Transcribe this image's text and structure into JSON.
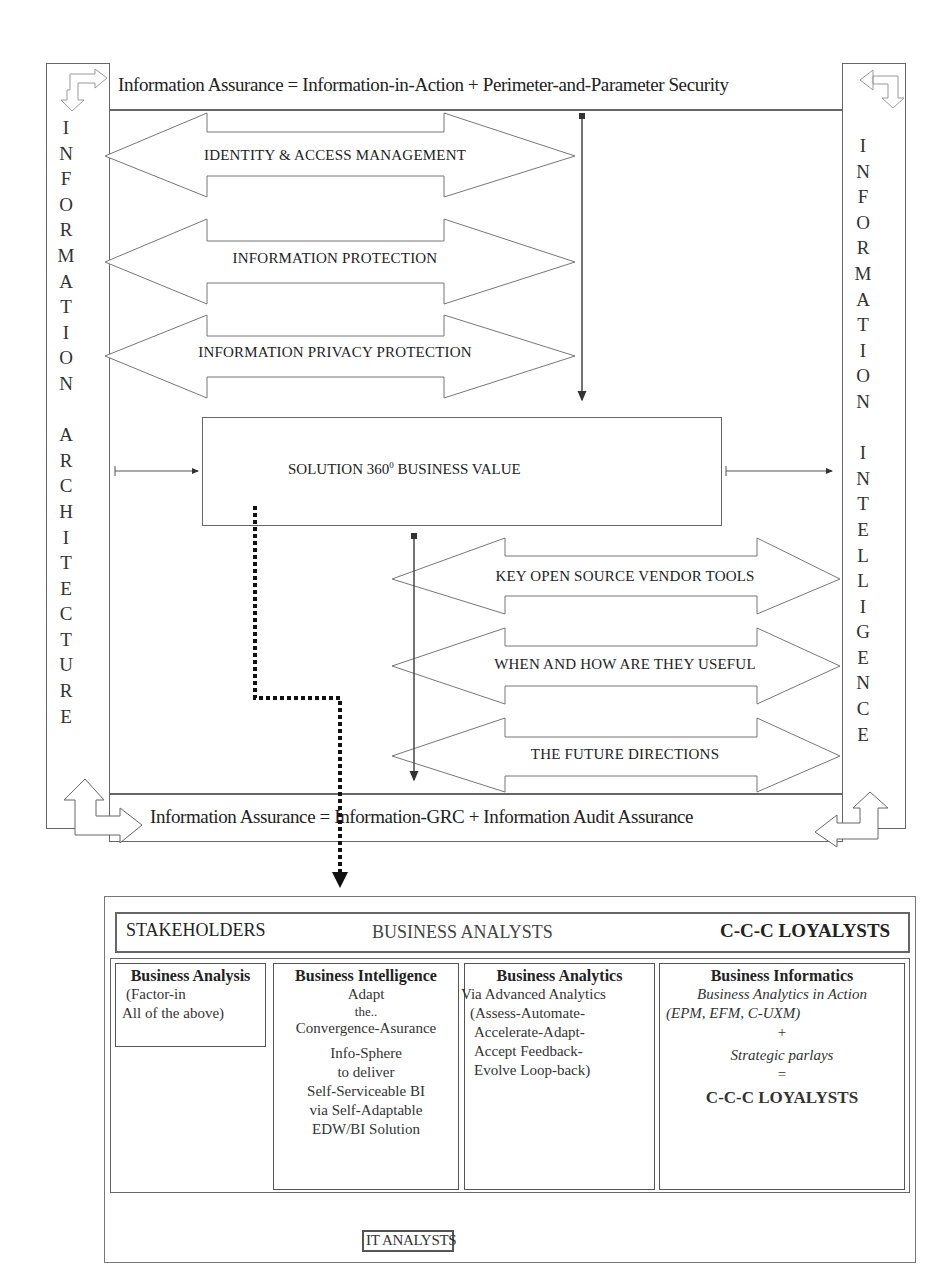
{
  "top_band": {
    "text": "Information Assurance = Information-in-Action + Perimeter-and-Parameter Security"
  },
  "bottom_band": {
    "text": "Information Assurance = Information-GRC + Information Audit Assurance"
  },
  "left_pillar": {
    "word1": [
      "I",
      "N",
      "F",
      "O",
      "R",
      "M",
      "A",
      "T",
      "I",
      "O",
      "N"
    ],
    "word2": [
      "A",
      "R",
      "C",
      "H",
      "I",
      "T",
      "E",
      "C",
      "T",
      "U",
      "R",
      "E"
    ],
    "label": "INFORMATION ARCHITECTURE"
  },
  "right_pillar": {
    "word1": [
      "I",
      "N",
      "F",
      "O",
      "R",
      "M",
      "A",
      "T",
      "I",
      "O",
      "N"
    ],
    "word2": [
      "I",
      "N",
      "T",
      "E",
      "L",
      "L",
      "I",
      "G",
      "E",
      "N",
      "C",
      "E"
    ],
    "label": "INFORMATION INTELLIGENCE"
  },
  "upper_arrows": [
    {
      "label": "IDENTITY & ACCESS MANAGEMENT"
    },
    {
      "label": "INFORMATION PROTECTION"
    },
    {
      "label": "INFORMATION PRIVACY PROTECTION"
    }
  ],
  "center_box": {
    "label_pre": "SOLUTION 360",
    "label_sup": "0",
    "label_post": " BUSINESS VALUE"
  },
  "lower_arrows": [
    {
      "label": "KEY OPEN SOURCE VENDOR TOOLS"
    },
    {
      "label": "WHEN AND HOW ARE THEY USEFUL"
    },
    {
      "label": "THE FUTURE DIRECTIONS"
    }
  ],
  "lower_panel": {
    "header": {
      "left": "STAKEHOLDERS",
      "center": "BUSINESS ANALYSTS",
      "right": "C-C-C LOYALYSTS"
    },
    "columns": [
      {
        "title": "Business Analysis",
        "lines": [
          "(Factor-in",
          "All of the above)"
        ]
      },
      {
        "title": "Business Intelligence",
        "lines": [
          "Adapt",
          "the..",
          "Convergence-Asurance",
          "Info-Sphere",
          "to deliver",
          "Self-Serviceable BI",
          "via Self-Adaptable",
          "EDW/BI Solution"
        ]
      },
      {
        "title": "Business Analytics",
        "lines": [
          "Via Advanced Analytics",
          "(Assess-Automate-",
          "Accelerate-Adapt-",
          "Accept Feedback-",
          "Evolve Loop-back)"
        ]
      },
      {
        "title": "Business Informatics",
        "lines": [
          "Business Analytics in Action",
          "(EPM, EFM, C-UXM)",
          "+",
          "Strategic parlays",
          "=",
          "C-C-C LOYALYSTS"
        ]
      }
    ],
    "footer": "IT ANALYSTS"
  },
  "colors": {
    "line": "#666666",
    "text": "#222222",
    "background": "#ffffff"
  }
}
